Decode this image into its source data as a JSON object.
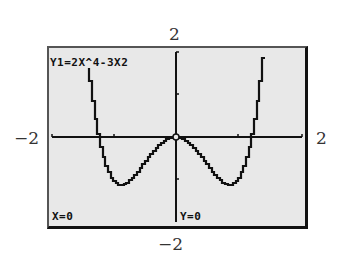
{
  "screen": {
    "equation": "Y1=2X^4-3X2",
    "x_readout": "X=0",
    "y_readout": "Y=0",
    "background_color": "#e8e8e8",
    "curve_color": "#111111"
  },
  "window_labels": {
    "ymax": "2",
    "ymin": "−2",
    "xmin": "−2",
    "xmax": "2"
  },
  "chart_data": {
    "type": "line",
    "title": "Y1=2X^4-3X2",
    "function": "y = 2x^4 - 3x^2",
    "xlabel": "",
    "ylabel": "",
    "xlim": [
      -2,
      2
    ],
    "ylim": [
      -2,
      2
    ],
    "x_ticks": [
      -1,
      1
    ],
    "y_ticks": [
      -1,
      1
    ],
    "grid": false,
    "trace_point": {
      "x": 0,
      "y": 0
    },
    "series": [
      {
        "name": "Y1",
        "x": [
          -1.3,
          -1.25,
          -1.2247,
          -1.2,
          -1.1,
          -1.0,
          -0.9,
          -0.866,
          -0.8,
          -0.7,
          -0.6,
          -0.5,
          -0.4,
          -0.3,
          -0.2,
          -0.1,
          0,
          0.1,
          0.2,
          0.3,
          0.4,
          0.5,
          0.6,
          0.7,
          0.8,
          0.866,
          0.9,
          1.0,
          1.1,
          1.2,
          1.2247,
          1.25,
          1.3,
          1.35
        ],
        "values": [
          0.642,
          0.195,
          0.0,
          -0.173,
          -0.702,
          -1.0,
          -1.118,
          -1.125,
          -1.101,
          -0.99,
          -0.821,
          -0.625,
          -0.429,
          -0.254,
          -0.117,
          -0.03,
          0,
          -0.03,
          -0.117,
          -0.254,
          -0.429,
          -0.625,
          -0.821,
          -0.99,
          -1.101,
          -1.125,
          -1.118,
          -1.0,
          -0.702,
          -0.173,
          0.0,
          0.195,
          0.642,
          1.854
        ]
      }
    ],
    "key_points": {
      "roots": [
        -1.2247,
        0,
        1.2247
      ],
      "minima": [
        {
          "x": -0.866,
          "y": -1.125
        },
        {
          "x": 0.866,
          "y": -1.125
        }
      ],
      "local_max": {
        "x": 0,
        "y": 0
      }
    }
  }
}
